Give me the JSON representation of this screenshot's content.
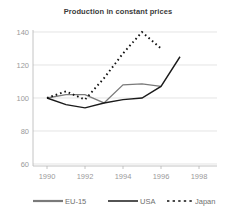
{
  "chart_data": {
    "type": "line",
    "title": "Production in constant prices",
    "xlabel": "",
    "ylabel": "",
    "xlim": [
      1990,
      1998
    ],
    "ylim": [
      60,
      140
    ],
    "xticks": [
      "1990",
      "1992",
      "1994",
      "1996",
      "1998"
    ],
    "yticks": [
      "60",
      "80",
      "100",
      "120",
      "140"
    ],
    "grid": true,
    "legend_position": "bottom",
    "x": [
      1990,
      1991,
      1992,
      1993,
      1994,
      1995,
      1996,
      1997
    ],
    "series": [
      {
        "name": "EU-15",
        "style": "solid",
        "color": "#7a7a7a",
        "values": [
          100,
          102,
          102,
          97,
          108,
          108.5,
          107,
          null
        ]
      },
      {
        "name": "USA",
        "style": "solid",
        "color": "#1a1a1a",
        "values": [
          100,
          96,
          94,
          97,
          99,
          100,
          107,
          125
        ]
      },
      {
        "name": "Japan",
        "style": "dotted",
        "color": "#111111",
        "values": [
          100,
          104,
          99,
          112,
          127,
          140,
          130,
          null
        ]
      }
    ]
  },
  "axis": {
    "y_labels": [
      "140",
      "120",
      "100",
      "80",
      "60"
    ],
    "x_labels": [
      "1990",
      "1992",
      "1994",
      "1996",
      "1998"
    ]
  },
  "legend": {
    "items": [
      {
        "label": "EU-15",
        "swatch": "solid-gray-line-swatch"
      },
      {
        "label": "USA",
        "swatch": "solid-black-line-swatch"
      },
      {
        "label": "Japan",
        "swatch": "dotted-black-line-swatch"
      }
    ]
  }
}
